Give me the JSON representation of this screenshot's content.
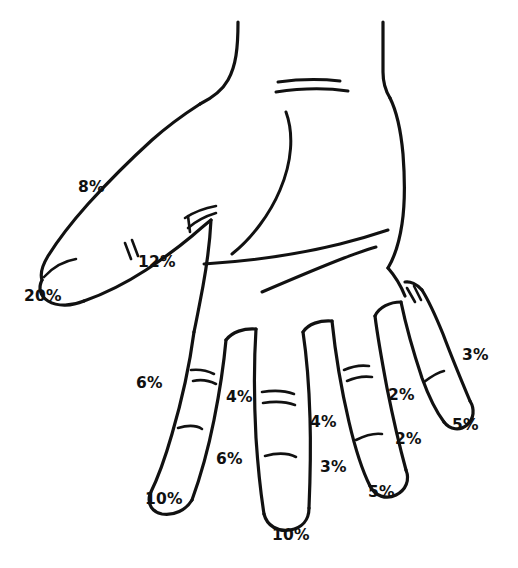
{
  "figure": {
    "name": "hand-impairment-diagram",
    "view": "palmar view of left hand",
    "background_color": "#ffffff",
    "ink_color": "#111111",
    "label_color": "#101010"
  },
  "chart_data": {
    "type": "diagram",
    "title": "",
    "subtitle": "",
    "xlabel": "",
    "ylabel": "",
    "legend": [],
    "units": "percent",
    "annotations": [
      {
        "id": "thumb-proximal",
        "digit": "thumb",
        "segment": "proximal phalanx / MP level",
        "text": "8%",
        "value": 8,
        "x": 78,
        "y": 180
      },
      {
        "id": "thumb-ip",
        "digit": "thumb",
        "segment": "interphalangeal level",
        "text": "12%",
        "value": 12,
        "x": 138,
        "y": 255
      },
      {
        "id": "thumb-tip",
        "digit": "thumb",
        "segment": "tip / total thumb",
        "text": "20%",
        "value": 20,
        "x": 24,
        "y": 289
      },
      {
        "id": "index-radial-proximal",
        "digit": "index",
        "segment": "proximal",
        "text": "6%",
        "value": 6,
        "x": 136,
        "y": 376
      },
      {
        "id": "index-ulnar-middle",
        "digit": "index",
        "segment": "middle",
        "text": "4%",
        "value": 4,
        "x": 226,
        "y": 390
      },
      {
        "id": "index-ulnar-distal",
        "digit": "index",
        "segment": "distal",
        "text": "6%",
        "value": 6,
        "x": 216,
        "y": 452
      },
      {
        "id": "index-tip",
        "digit": "index",
        "segment": "tip / total digit",
        "text": "10%",
        "value": 10,
        "x": 145,
        "y": 492
      },
      {
        "id": "middle-ulnar-proximal",
        "digit": "middle",
        "segment": "proximal",
        "text": "4%",
        "value": 4,
        "x": 310,
        "y": 415
      },
      {
        "id": "middle-ulnar-distal",
        "digit": "middle",
        "segment": "distal",
        "text": "3%",
        "value": 3,
        "x": 320,
        "y": 460
      },
      {
        "id": "middle-tip",
        "digit": "middle",
        "segment": "tip / total digit",
        "text": "10%",
        "value": 10,
        "x": 272,
        "y": 528
      },
      {
        "id": "ring-ulnar-proximal",
        "digit": "ring",
        "segment": "proximal",
        "text": "2%",
        "value": 2,
        "x": 388,
        "y": 388
      },
      {
        "id": "ring-ulnar-distal",
        "digit": "ring",
        "segment": "distal",
        "text": "2%",
        "value": 2,
        "x": 395,
        "y": 432
      },
      {
        "id": "ring-tip",
        "digit": "ring",
        "segment": "tip / total digit",
        "text": "5%",
        "value": 5,
        "x": 368,
        "y": 485
      },
      {
        "id": "little-ulnar-proximal",
        "digit": "little",
        "segment": "proximal",
        "text": "3%",
        "value": 3,
        "x": 462,
        "y": 348
      },
      {
        "id": "little-tip",
        "digit": "little",
        "segment": "tip / total digit",
        "text": "5%",
        "value": 5,
        "x": 452,
        "y": 418
      }
    ],
    "series": [
      {
        "name": "impairment percent by label",
        "categories": [
          "8%",
          "12%",
          "20%",
          "6%",
          "4%",
          "6%",
          "10%",
          "4%",
          "3%",
          "10%",
          "2%",
          "2%",
          "5%",
          "3%",
          "5%"
        ],
        "values": [
          8,
          12,
          20,
          6,
          4,
          6,
          10,
          4,
          3,
          10,
          2,
          2,
          5,
          3,
          5
        ]
      }
    ]
  }
}
